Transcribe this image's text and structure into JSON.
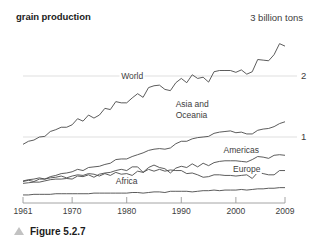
{
  "figure": {
    "title": "grain production",
    "unit_note": "3 billion tons",
    "caption": "Figure 5.2.7",
    "caption_marker": "triangle-up-icon"
  },
  "colors": {
    "line": "#4a4a4a",
    "gridline": "#e0e0e0",
    "axis": "#9a9a9a",
    "text": "#3d3d3d",
    "title": "#1b1b1b",
    "triangle": "#c2c2c2",
    "background": "#ffffff"
  },
  "chart_data": {
    "type": "line",
    "title": "grain production",
    "subtitle": "",
    "xlabel": "",
    "ylabel": "3 billion tons",
    "xlim": [
      1961,
      2009
    ],
    "ylim": [
      0,
      3
    ],
    "grid": true,
    "grid_values": [
      1,
      2
    ],
    "ytick_labels": [
      "1",
      "2"
    ],
    "xtick_labels": [
      "1961",
      "1970",
      "1980",
      "1990",
      "2000",
      "2009"
    ],
    "xticks": [
      1961,
      1970,
      1980,
      1990,
      2000,
      2009
    ],
    "legend_position": "inline-annotations",
    "annotations": [
      {
        "text": "World",
        "x": 1981,
        "y": 2.0
      },
      {
        "text": "Asia and Oceania",
        "x": 1992,
        "y": 1.45
      },
      {
        "text": "Americas",
        "x": 2001,
        "y": 0.78
      },
      {
        "text": "Europe",
        "x": 2002,
        "y": 0.47
      },
      {
        "text": "Africa",
        "x": 1980,
        "y": 0.28
      }
    ],
    "x": [
      1961,
      1962,
      1963,
      1964,
      1965,
      1966,
      1967,
      1968,
      1969,
      1970,
      1971,
      1972,
      1973,
      1974,
      1975,
      1976,
      1977,
      1978,
      1979,
      1980,
      1981,
      1982,
      1983,
      1984,
      1985,
      1986,
      1987,
      1988,
      1989,
      1990,
      1991,
      1992,
      1993,
      1994,
      1995,
      1996,
      1997,
      1998,
      1999,
      2000,
      2001,
      2002,
      2003,
      2004,
      2005,
      2006,
      2007,
      2008,
      2009
    ],
    "series": [
      {
        "name": "World",
        "values": [
          0.88,
          0.93,
          0.95,
          1.0,
          1.01,
          1.09,
          1.12,
          1.16,
          1.16,
          1.2,
          1.3,
          1.26,
          1.36,
          1.31,
          1.36,
          1.47,
          1.45,
          1.58,
          1.56,
          1.56,
          1.64,
          1.71,
          1.65,
          1.81,
          1.84,
          1.85,
          1.78,
          1.76,
          1.89,
          1.96,
          1.89,
          2.02,
          1.96,
          1.98,
          1.9,
          2.07,
          2.09,
          2.09,
          2.09,
          2.06,
          2.1,
          2.03,
          2.07,
          2.27,
          2.26,
          2.25,
          2.35,
          2.53,
          2.49
        ]
      },
      {
        "name": "Asia and Oceania",
        "values": [
          0.28,
          0.3,
          0.31,
          0.33,
          0.31,
          0.35,
          0.37,
          0.4,
          0.41,
          0.43,
          0.47,
          0.45,
          0.5,
          0.51,
          0.52,
          0.55,
          0.57,
          0.63,
          0.64,
          0.64,
          0.68,
          0.71,
          0.74,
          0.78,
          0.8,
          0.81,
          0.8,
          0.82,
          0.89,
          0.93,
          0.93,
          0.97,
          0.99,
          1.0,
          1.01,
          1.06,
          1.08,
          1.09,
          1.1,
          1.07,
          1.08,
          1.05,
          1.05,
          1.11,
          1.13,
          1.14,
          1.17,
          1.22,
          1.25
        ]
      },
      {
        "name": "Americas",
        "values": [
          0.24,
          0.25,
          0.26,
          0.26,
          0.28,
          0.3,
          0.31,
          0.31,
          0.32,
          0.31,
          0.36,
          0.35,
          0.38,
          0.34,
          0.39,
          0.41,
          0.42,
          0.45,
          0.47,
          0.45,
          0.51,
          0.51,
          0.42,
          0.5,
          0.54,
          0.5,
          0.48,
          0.41,
          0.49,
          0.52,
          0.5,
          0.56,
          0.51,
          0.57,
          0.53,
          0.58,
          0.6,
          0.61,
          0.61,
          0.61,
          0.6,
          0.59,
          0.63,
          0.68,
          0.67,
          0.65,
          0.7,
          0.71,
          0.7
        ]
      },
      {
        "name": "Europe",
        "values": [
          0.27,
          0.29,
          0.27,
          0.31,
          0.31,
          0.33,
          0.34,
          0.36,
          0.33,
          0.36,
          0.38,
          0.37,
          0.4,
          0.39,
          0.36,
          0.4,
          0.37,
          0.42,
          0.39,
          0.4,
          0.37,
          0.44,
          0.42,
          0.47,
          0.44,
          0.47,
          0.44,
          0.46,
          0.45,
          0.45,
          0.4,
          0.41,
          0.38,
          0.34,
          0.35,
          0.38,
          0.38,
          0.37,
          0.37,
          0.36,
          0.37,
          0.38,
          0.32,
          0.42,
          0.4,
          0.38,
          0.38,
          0.45,
          0.45
        ]
      },
      {
        "name": "Africa",
        "values": [
          0.05,
          0.05,
          0.06,
          0.06,
          0.06,
          0.06,
          0.07,
          0.07,
          0.07,
          0.07,
          0.07,
          0.07,
          0.07,
          0.08,
          0.08,
          0.08,
          0.08,
          0.08,
          0.08,
          0.08,
          0.09,
          0.09,
          0.08,
          0.09,
          0.1,
          0.1,
          0.09,
          0.11,
          0.11,
          0.11,
          0.11,
          0.1,
          0.11,
          0.12,
          0.12,
          0.13,
          0.12,
          0.13,
          0.13,
          0.13,
          0.14,
          0.13,
          0.14,
          0.15,
          0.15,
          0.16,
          0.16,
          0.17,
          0.17
        ]
      }
    ]
  }
}
